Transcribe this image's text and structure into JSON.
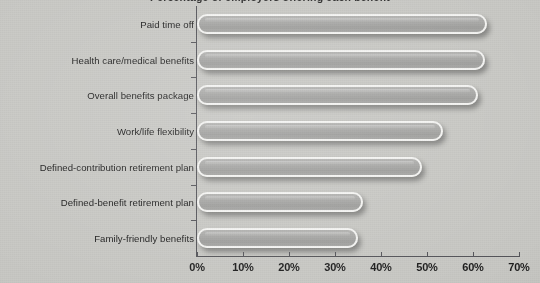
{
  "chart_data": {
    "type": "bar",
    "orientation": "horizontal",
    "title": "Percentage of employers offering each benefit",
    "xlabel": "",
    "ylabel": "",
    "xlim": [
      0,
      70
    ],
    "grid": false,
    "legend": null,
    "categories": [
      "Paid time off",
      "Health care/medical benefits",
      "Overall benefits package",
      "Work/life flexibility",
      "Defined-contribution retirement plan",
      "Defined-benefit retirement plan",
      "Family-friendly benefits"
    ],
    "values": [
      63,
      62.5,
      61,
      53.5,
      49,
      36,
      35
    ],
    "tick_labels": [
      "0%",
      "10%",
      "20%",
      "30%",
      "40%",
      "50%",
      "60%",
      "70%"
    ],
    "tick_values": [
      0,
      10,
      20,
      30,
      40,
      50,
      60,
      70
    ],
    "colors": {
      "background": "#c8c8c4",
      "bar_fill": "#a9a9a7",
      "bar_outline": "#f4f4f2",
      "axis": "#55555a",
      "text": "#1b1b1b"
    }
  }
}
